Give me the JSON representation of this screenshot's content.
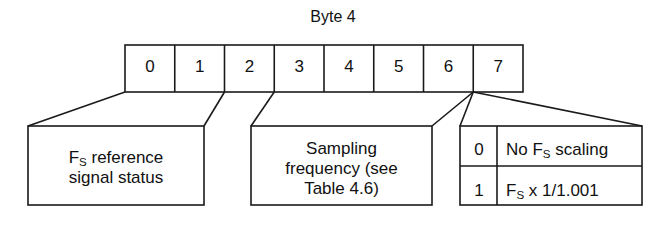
{
  "title": "Byte 4",
  "bit_row": {
    "name": "byte-4-bit-field",
    "bits": [
      "0",
      "1",
      "2",
      "3",
      "4",
      "5",
      "6",
      "7"
    ]
  },
  "fields": [
    {
      "id": "fs-reference-signal-status",
      "bits": "0-1",
      "lines": [
        "F",
        "S",
        " reference",
        "signal status"
      ],
      "line1_pre": "F",
      "line1_sub": "S",
      "line1_post": " reference",
      "line2": "signal status"
    },
    {
      "id": "sampling-frequency",
      "bits": "2-6",
      "line1": "Sampling",
      "line2": "frequency (see",
      "line3": "Table 4.6)"
    }
  ],
  "scaling_table": {
    "id": "fs-scaling-table",
    "bit": "7",
    "rows": [
      {
        "code": "0",
        "desc_pre": "No F",
        "desc_sub": "S",
        "desc_post": " scaling"
      },
      {
        "code": "1",
        "desc_pre": "F",
        "desc_sub": "S",
        "desc_post": " x 1/1.001"
      }
    ]
  },
  "colors": {
    "stroke": "#1a1a1a",
    "text": "#111111",
    "background": "#ffffff"
  }
}
